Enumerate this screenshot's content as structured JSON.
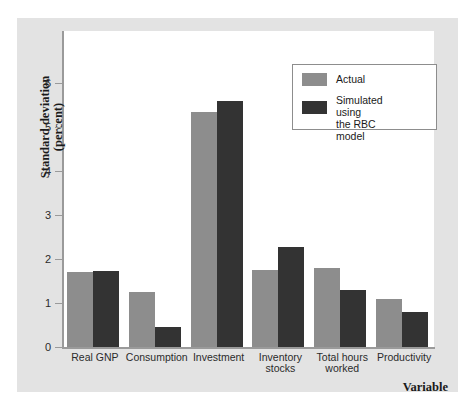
{
  "chart_data": {
    "type": "bar",
    "title": "",
    "xlabel": "Variable",
    "ylabel": "Standard deviation\n(percent)",
    "ylabel_line1": "Standard deviation",
    "ylabel_line2": "(percent)",
    "categories": [
      "Real GNP",
      "Consumption",
      "Investment",
      "Inventory\nstocks",
      "Total hours\nworked",
      "Productivity"
    ],
    "series": [
      {
        "name": "Actual",
        "color": "#8d8d8d",
        "values": [
          1.7,
          1.25,
          5.35,
          1.75,
          1.8,
          1.1
        ]
      },
      {
        "name": "Simulated using\nthe RBC model",
        "color": "#333333",
        "values": [
          1.72,
          0.45,
          5.6,
          2.28,
          1.3,
          0.8
        ]
      }
    ],
    "ylim": [
      0,
      6.6
    ],
    "yticks": [
      0,
      1,
      2,
      3,
      4,
      5,
      6
    ],
    "ytick_labels": [
      "0",
      "1",
      "2",
      "3",
      "4",
      "5",
      "6"
    ],
    "grid": false,
    "legend_position": "top-right"
  },
  "legend": {
    "items": [
      {
        "label": "Actual",
        "swatch": "actual"
      },
      {
        "label": "Simulated using\nthe RBC model",
        "swatch": "sim"
      }
    ]
  },
  "colors": {
    "actual": "#8d8d8d",
    "simulated": "#333333",
    "figure_background": "#e3e3e3",
    "panel_background": "#ffffff",
    "axis": "#9a9a9a"
  }
}
